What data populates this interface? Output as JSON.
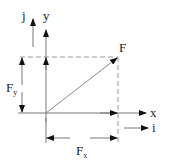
{
  "labels": {
    "j": "j",
    "y": "y",
    "F": "F",
    "Fy_main": "F",
    "Fy_sub": "y",
    "x": "x",
    "i": "i",
    "Fx_main": "F",
    "Fx_sub": "x"
  },
  "colors": {
    "line": "#222222",
    "dashed": "#999999",
    "vector": "#888888"
  }
}
